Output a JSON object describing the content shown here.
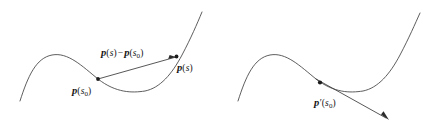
{
  "figure": {
    "background_color": "#ffffff",
    "curve_color": "#4c4c4c",
    "line_color": "#3a3a3a",
    "marker_color": "#1c1c1c",
    "text_color": "#161616",
    "panel_count": 2
  },
  "panels": [
    {
      "name": "left-panel",
      "description": "Curve with secant vector from p(s0) to p(s)",
      "curve_path": "M 20,101 C 28,76 36,58 52,55 C 68,52 82,66 98,79 C 116,93 132,93 145,91 C 160,88 172,74 182,55 C 191,38 197,24 202,12",
      "secant_path": "M 98,79 L 176,57",
      "points": [
        {
          "name": "p-s0-dot",
          "x": 98,
          "y": 79
        },
        {
          "name": "p-s-dot",
          "x": 176,
          "y": 57
        }
      ],
      "arrowhead": {
        "x": 176,
        "y": 57,
        "angle_deg": -15.8
      },
      "labels": [
        {
          "name": "secant-vector-label",
          "tex": "p(s) - p(s0)",
          "x": 101,
          "y": 48
        },
        {
          "name": "point-p-s-label",
          "tex": "p(s)",
          "x": 177,
          "y": 63
        },
        {
          "name": "point-p-s0-label",
          "tex": "p(s0)",
          "x": 72,
          "y": 86
        }
      ]
    },
    {
      "name": "right-panel",
      "description": "Same curve with tangent vector p'(s0) at the point",
      "curve_path": "M 238,101 C 246,76 254,58 270,55 C 286,52 300,66 316,79 C 334,93 350,93 363,91 C 378,88 390,74 400,55 C 409,38 415,24 420,13",
      "tangent_path": "M 316,79 L 386,118",
      "points": [
        {
          "name": "p-s0-dot",
          "x": 320,
          "y": 82
        }
      ],
      "arrowhead": {
        "x": 389,
        "y": 120,
        "angle_deg": 29.5
      },
      "labels": [
        {
          "name": "tangent-vector-label",
          "tex": "p'(s0)",
          "x": 314,
          "y": 98
        }
      ]
    }
  ],
  "labels": {
    "secant_vector": {
      "vector_symbol": "p",
      "open_paren": "(",
      "arg": "s",
      "close_paren": ")",
      "operator": "−",
      "vector_symbol_2": "p",
      "arg_2": "s",
      "subscript_2": "0",
      "plain_text": "p(s) − p(s₀)"
    },
    "point_p_s": {
      "vector_symbol": "p",
      "open_paren": "(",
      "arg": "s",
      "close_paren": ")",
      "plain_text": "p(s)"
    },
    "point_p_s0": {
      "vector_symbol": "p",
      "open_paren": "(",
      "arg": "s",
      "subscript": "0",
      "close_paren": ")",
      "plain_text": "p(s₀)"
    },
    "tangent_p_prime_s0": {
      "vector_symbol": "p",
      "prime": "′",
      "open_paren": "(",
      "arg": "s",
      "subscript": "0",
      "close_paren": ")",
      "plain_text": "p′(s₀)"
    }
  }
}
